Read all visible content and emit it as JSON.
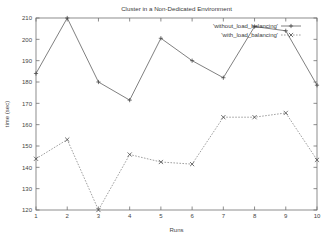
{
  "chart_data": {
    "type": "line",
    "title": "Cluster in a Non-Dedicated Environment",
    "xlabel": "Runs",
    "ylabel": "time (sec)",
    "x": [
      1,
      2,
      3,
      4,
      5,
      6,
      7,
      8,
      9,
      10
    ],
    "xtick_labels": [
      "1",
      "2",
      "3",
      "4",
      "5",
      "6",
      "7",
      "8",
      "9",
      "10"
    ],
    "ytick_labels": [
      "120",
      "130",
      "140",
      "150",
      "160",
      "170",
      "180",
      "190",
      "200",
      "210"
    ],
    "ytick_values": [
      120,
      130,
      140,
      150,
      160,
      170,
      180,
      190,
      200,
      210
    ],
    "xlim": [
      1,
      10
    ],
    "ylim": [
      120,
      210
    ],
    "grid": false,
    "legend_position": "top-right",
    "series": [
      {
        "name": "'without_load_balancing'",
        "marker": "+",
        "linestyle": "solid",
        "color": "#555555",
        "values": [
          184,
          210,
          180,
          171.5,
          200.5,
          190,
          182,
          206,
          204,
          178.5
        ]
      },
      {
        "name": "'with_load_balancing'",
        "marker": "x",
        "linestyle": "dashed",
        "color": "#777777",
        "values": [
          144,
          153,
          120,
          146,
          142.5,
          141.5,
          163.5,
          163.5,
          165.5,
          143.5
        ]
      }
    ]
  },
  "legend": {
    "entries": [
      {
        "label": "'without_load_balancing'",
        "marker": "+"
      },
      {
        "label": "'with_load_balancing'",
        "marker": "x"
      }
    ]
  }
}
